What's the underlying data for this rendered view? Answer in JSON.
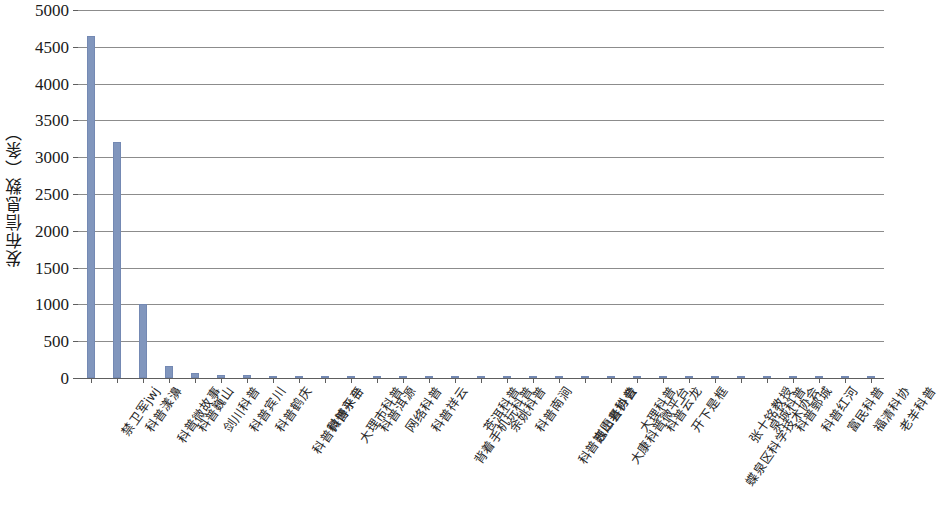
{
  "chart_data": {
    "type": "bar",
    "title": "",
    "xlabel": "",
    "ylabel": "发布信息数（条）",
    "ylim": [
      0,
      5000
    ],
    "ytick_step": 500,
    "yticks": [
      0,
      500,
      1000,
      1500,
      2000,
      2500,
      3000,
      3500,
      4000,
      4500,
      5000
    ],
    "ytick_labels": [
      "0",
      "500",
      "1000",
      "1500",
      "2000",
      "2500",
      "3000",
      "3500",
      "4000",
      "4500",
      "5000"
    ],
    "grid": true,
    "legend": "none",
    "bar_color": "#8196bd",
    "bar_border_color": "#7489b3",
    "axis_color": "#5e5e5e",
    "gridline_color": "#8c8c8c",
    "categories": [
      "禁卫军jwj",
      "科普漾濞",
      "科普微故事",
      "科普巍山",
      "剑川科普",
      "科普宾川",
      "科普鹤庆",
      "科普微博平台",
      "科普永平",
      "大理市科普",
      "科普洱源",
      "网络科普",
      "科普祥云",
      "背着手机玩科普",
      "苍洱科普",
      "余姚科普",
      "科普南涧",
      "科普志愿者协会",
      "巍山县科普",
      "大康科普微平台",
      "大理科普",
      "科普云龙",
      "开下是框",
      "蝶泉区科学技术协会",
      "张十铭教授",
      "泉城科普",
      "科普鄄城",
      "科普红河",
      "富民科普",
      "福清科协",
      "老羊科普"
    ],
    "values": [
      4650,
      3200,
      1000,
      170,
      70,
      45,
      35,
      28,
      22,
      18,
      15,
      14,
      12,
      11,
      10,
      9,
      8,
      8,
      7,
      7,
      6,
      6,
      5,
      5,
      4,
      4,
      3,
      3,
      2,
      2,
      2
    ]
  }
}
